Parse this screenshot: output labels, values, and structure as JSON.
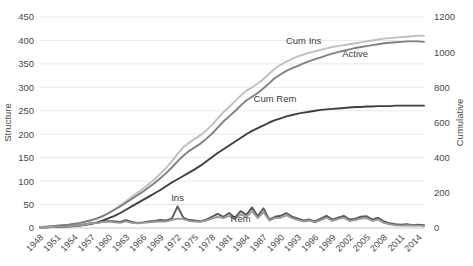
{
  "chart_data": {
    "type": "line",
    "title": "",
    "xlabel": "",
    "ylabel": "Structure",
    "y2label": "Cumulative",
    "ylim": [
      0,
      450
    ],
    "y2lim": [
      0,
      1200
    ],
    "grid": true,
    "legend_position": "inline-annotations",
    "yticks": [
      "0",
      "50",
      "100",
      "150",
      "200",
      "250",
      "300",
      "350",
      "400",
      "450"
    ],
    "y2ticks": [
      "0",
      "200",
      "400",
      "600",
      "800",
      "1000",
      "1200"
    ],
    "x": [
      1948,
      1949,
      1950,
      1951,
      1952,
      1953,
      1954,
      1955,
      1956,
      1957,
      1958,
      1959,
      1960,
      1961,
      1962,
      1963,
      1964,
      1965,
      1966,
      1967,
      1968,
      1969,
      1970,
      1971,
      1972,
      1973,
      1974,
      1975,
      1976,
      1977,
      1978,
      1979,
      1980,
      1981,
      1982,
      1983,
      1984,
      1985,
      1986,
      1987,
      1988,
      1989,
      1990,
      1991,
      1992,
      1993,
      1994,
      1995,
      1996,
      1997,
      1998,
      1999,
      2000,
      2001,
      2002,
      2003,
      2004,
      2005,
      2006,
      2007,
      2008,
      2009,
      2010,
      2011,
      2012,
      2013,
      2014,
      2015
    ],
    "xticks": [
      "1948",
      "1951",
      "1954",
      "1957",
      "1960",
      "1963",
      "1966",
      "1969",
      "1972",
      "1975",
      "1978",
      "1981",
      "1984",
      "1987",
      "1990",
      "1993",
      "1996",
      "1999",
      "2002",
      "2005",
      "2008",
      "2011",
      "2014"
    ],
    "series": [
      {
        "name": "Cum Ins",
        "color": "#bfbfbf",
        "axis": "left",
        "label_x": 1994,
        "label_y": 393,
        "values": [
          2,
          3,
          4,
          5,
          6,
          7,
          8,
          10,
          13,
          16,
          20,
          25,
          32,
          40,
          48,
          57,
          66,
          75,
          84,
          94,
          104,
          116,
          128,
          142,
          158,
          172,
          182,
          190,
          198,
          208,
          220,
          234,
          247,
          258,
          270,
          282,
          293,
          300,
          308,
          318,
          329,
          340,
          348,
          355,
          361,
          366,
          370,
          374,
          377,
          380,
          383,
          386,
          388,
          390,
          392,
          394,
          396,
          398,
          400,
          402,
          404,
          405,
          406,
          407,
          408,
          409,
          410,
          410
        ]
      },
      {
        "name": "Active",
        "color": "#808080",
        "axis": "left",
        "label_x": 2003,
        "label_y": 365,
        "values": [
          2,
          3,
          4,
          5,
          6,
          7,
          9,
          11,
          14,
          17,
          21,
          26,
          32,
          39,
          46,
          54,
          62,
          70,
          78,
          87,
          96,
          106,
          117,
          129,
          142,
          154,
          164,
          172,
          180,
          190,
          201,
          214,
          227,
          238,
          249,
          261,
          272,
          280,
          288,
          298,
          309,
          320,
          328,
          335,
          341,
          346,
          351,
          356,
          360,
          364,
          368,
          372,
          375,
          378,
          381,
          384,
          386,
          388,
          390,
          392,
          394,
          395,
          396,
          397,
          398,
          398,
          398,
          397
        ]
      },
      {
        "name": "Cum Rem",
        "color": "#3f3f3f",
        "axis": "left",
        "label_x": 1989,
        "label_y": 268,
        "values": [
          1,
          1,
          2,
          2,
          3,
          3,
          4,
          5,
          7,
          9,
          12,
          16,
          21,
          26,
          32,
          39,
          46,
          53,
          60,
          67,
          74,
          81,
          89,
          97,
          104,
          111,
          118,
          125,
          133,
          142,
          151,
          160,
          168,
          176,
          184,
          192,
          200,
          207,
          213,
          219,
          225,
          230,
          234,
          238,
          241,
          244,
          246,
          248,
          250,
          252,
          253,
          254,
          255,
          256,
          257,
          258,
          258,
          259,
          259,
          260,
          260,
          260,
          261,
          261,
          261,
          261,
          261,
          261
        ]
      },
      {
        "name": "Ins",
        "color": "#595959",
        "axis": "left",
        "label_x": 1972,
        "label_y": 58,
        "values": [
          2,
          2,
          2,
          3,
          3,
          4,
          5,
          6,
          8,
          10,
          11,
          13,
          15,
          14,
          13,
          17,
          13,
          11,
          12,
          14,
          15,
          17,
          16,
          20,
          46,
          22,
          17,
          16,
          14,
          18,
          24,
          30,
          24,
          32,
          22,
          36,
          28,
          44,
          25,
          42,
          18,
          24,
          26,
          32,
          24,
          20,
          16,
          18,
          14,
          20,
          26,
          18,
          22,
          26,
          18,
          20,
          24,
          25,
          18,
          22,
          14,
          10,
          8,
          7,
          8,
          6,
          7,
          6
        ]
      },
      {
        "name": "Rem",
        "color": "#9a9a9a",
        "axis": "left",
        "label_x": 1983,
        "label_y": 12,
        "values": [
          2,
          2,
          2,
          3,
          3,
          4,
          5,
          6,
          8,
          10,
          11,
          13,
          14,
          12,
          11,
          14,
          11,
          10,
          11,
          12,
          13,
          14,
          14,
          17,
          20,
          19,
          15,
          14,
          13,
          16,
          20,
          24,
          21,
          26,
          19,
          29,
          24,
          36,
          21,
          34,
          16,
          21,
          22,
          27,
          21,
          17,
          14,
          16,
          12,
          17,
          22,
          15,
          19,
          22,
          15,
          17,
          20,
          21,
          15,
          18,
          11,
          8,
          6,
          5,
          6,
          5,
          5,
          4
        ]
      }
    ]
  },
  "axis": {
    "left_title": "Structure",
    "right_title": "Cumulative"
  }
}
